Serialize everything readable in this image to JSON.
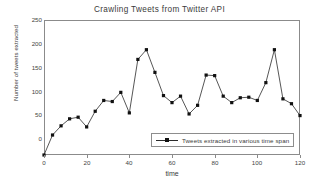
{
  "chart_data": {
    "type": "line",
    "title": "Crawling Tweets from Twitter API",
    "xlabel": "time",
    "ylabel": "Number of tweets extracted",
    "xlim": [
      0,
      120
    ],
    "ylim": [
      0,
      250
    ],
    "xticks": [
      0,
      20,
      40,
      60,
      80,
      100,
      120
    ],
    "yticks": [
      0,
      50,
      100,
      150,
      200,
      250
    ],
    "grid": false,
    "legend_position": "lower right",
    "marker": "square",
    "line_color": "#2b2b2b",
    "marker_color": "#111111",
    "series": [
      {
        "name": "Tweets extracted in various time span",
        "x": [
          0,
          4,
          8,
          12,
          16,
          20,
          24,
          28,
          32,
          36,
          40,
          44,
          48,
          52,
          56,
          60,
          64,
          68,
          72,
          76,
          80,
          84,
          88,
          92,
          96,
          100,
          104,
          108,
          112,
          116,
          120
        ],
        "values": [
          0,
          37,
          54,
          67,
          70,
          52,
          81,
          101,
          99,
          116,
          78,
          177,
          195,
          153,
          110,
          97,
          109,
          76,
          92,
          148,
          147,
          109,
          97,
          106,
          107,
          101,
          134,
          195,
          104,
          95,
          73
        ]
      }
    ]
  },
  "axis": {
    "ytick_labels": [
      "250",
      "200",
      "150",
      "100",
      "50",
      "0"
    ],
    "xtick_labels": [
      "0",
      "20",
      "40",
      "60",
      "80",
      "100",
      "120"
    ]
  },
  "legend": {
    "label": "Tweets extracted in various time span"
  }
}
